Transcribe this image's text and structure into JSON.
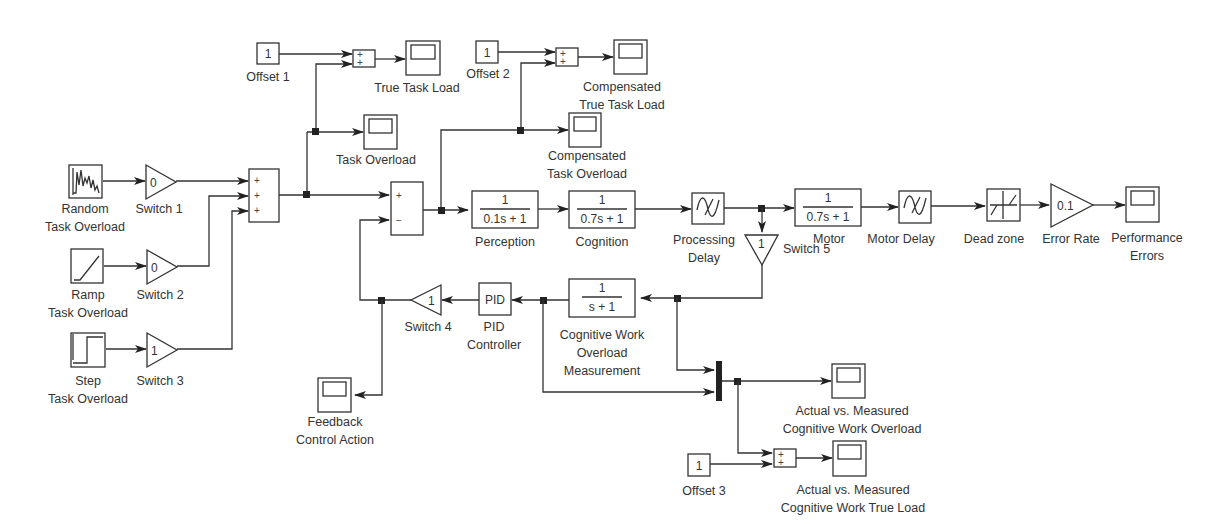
{
  "diagram": {
    "type": "simulink-block-diagram",
    "sources": {
      "random": {
        "line1": "Random",
        "line2": "Task Overload"
      },
      "ramp": {
        "line1": "Ramp",
        "line2": "Task Overload"
      },
      "step": {
        "line1": "Step",
        "line2": "Task Overload"
      }
    },
    "gains": {
      "switch1": {
        "value": "0",
        "label": "Switch 1"
      },
      "switch2": {
        "value": "0",
        "label": "Switch 2"
      },
      "switch3": {
        "value": "1",
        "label": "Switch 3"
      },
      "switch4": {
        "value": "1",
        "label": "Switch 4"
      },
      "switch5": {
        "value": "1",
        "label": "Switch 5"
      },
      "error_rate": {
        "value": "0.1",
        "label": "Error Rate"
      }
    },
    "sums": {
      "sum_inputs": {
        "signs": [
          "+",
          "+",
          "+"
        ]
      },
      "sum_error": {
        "signs": [
          "+",
          "−"
        ]
      },
      "sum_offset1": {
        "signs": [
          "+",
          "+"
        ]
      },
      "sum_offset2": {
        "signs": [
          "+",
          "+"
        ]
      },
      "sum_offset3": {
        "signs": [
          "+",
          "+"
        ]
      }
    },
    "constants": {
      "offset1": {
        "value": "1",
        "label": "Offset 1"
      },
      "offset2": {
        "value": "1",
        "label": "Offset 2"
      },
      "offset3": {
        "value": "1",
        "label": "Offset 3"
      }
    },
    "transfer_functions": {
      "perception": {
        "num": "1",
        "den": "0.1s + 1",
        "label": "Perception"
      },
      "cognition": {
        "num": "1",
        "den": "0.7s + 1",
        "label": "Cognition"
      },
      "motor": {
        "num": "1",
        "den": "0.7s + 1",
        "label": "Motor"
      },
      "measurement": {
        "num": "1",
        "den": "s + 1",
        "label1": "Cognitive Work",
        "label2": "Overload",
        "label3": "Measurement"
      }
    },
    "delays": {
      "processing": {
        "line1": "Processing",
        "line2": "Delay"
      },
      "motor": {
        "label": "Motor Delay"
      }
    },
    "dead_zone": {
      "label": "Dead zone"
    },
    "pid": {
      "text": "PID",
      "line1": "PID",
      "line2": "Controller"
    },
    "scopes": {
      "true_task_load": {
        "line1": "True Task Load"
      },
      "task_overload": {
        "line1": "Task Overload"
      },
      "comp_true_task_load": {
        "line1": "Compensated",
        "line2": "True Task Load"
      },
      "comp_task_overload": {
        "line1": "Compensated",
        "line2": "Task Overload"
      },
      "performance_errors": {
        "line1": "Performance",
        "line2": "Errors"
      },
      "feedback": {
        "line1": "Feedback",
        "line2": "Control Action"
      },
      "actual_overload": {
        "line1": "Actual vs. Measured",
        "line2": "Cognitive Work Overload"
      },
      "actual_true_load": {
        "line1": "Actual vs. Measured",
        "line2": "Cognitive Work True Load"
      }
    }
  }
}
